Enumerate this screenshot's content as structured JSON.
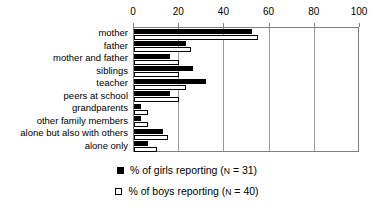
{
  "chart_data": {
    "type": "bar",
    "orientation": "horizontal",
    "title": "",
    "xlabel": "",
    "ylabel": "",
    "xlim": [
      0,
      100
    ],
    "xticks": [
      0,
      20,
      40,
      60,
      80,
      100
    ],
    "xtick_labels": [
      "0",
      "20",
      "40",
      "60",
      "80",
      "100"
    ],
    "grid": true,
    "grid_axis": "x",
    "legend_position": "bottom",
    "categories": [
      "mother",
      "father",
      "mother and father",
      "siblings",
      "teacher",
      "peers at school",
      "grandparents",
      "other family members",
      "alone but also with others",
      "alone only"
    ],
    "series": [
      {
        "name": "% of girls reporting (N = 31)",
        "color": "#000000",
        "fill": "solid",
        "values": [
          52,
          23,
          16,
          26,
          32,
          16,
          3,
          3,
          13,
          6
        ]
      },
      {
        "name": "% of boys reporting (N = 40)",
        "color": "#ffffff",
        "fill": "open",
        "values": [
          55,
          25,
          20,
          20,
          23,
          20,
          6,
          6,
          15,
          10
        ]
      }
    ]
  },
  "legend": {
    "entries": [
      {
        "swatch": "filled-square",
        "prefix": "% of girls reporting (",
        "n_symbol": "N",
        "suffix": " = 31)"
      },
      {
        "swatch": "open-square",
        "prefix": "% of boys reporting (",
        "n_symbol": "N",
        "suffix": " = 40)"
      }
    ]
  }
}
